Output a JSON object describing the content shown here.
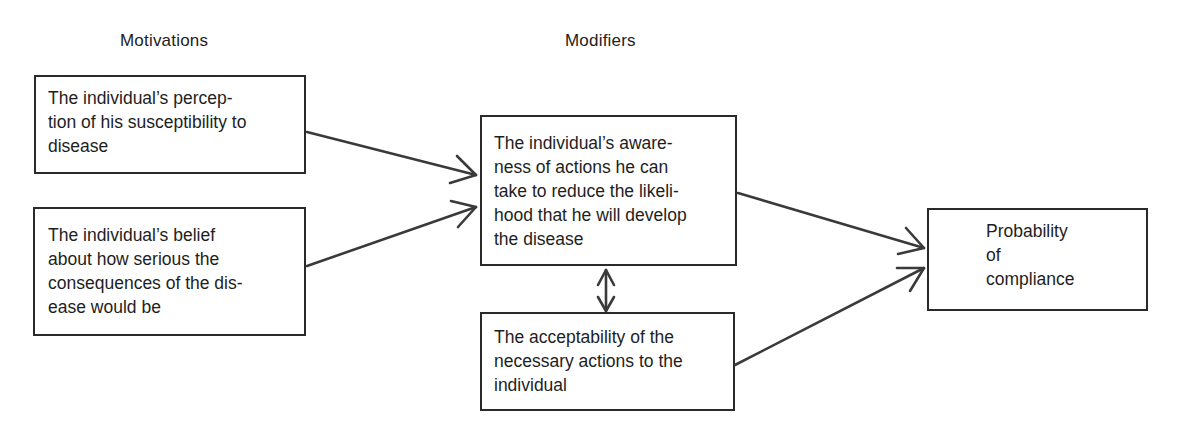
{
  "diagram": {
    "type": "flow",
    "columns": {
      "motivations": "Motivations",
      "modifiers": "Modifiers"
    },
    "nodes": {
      "susceptibility": {
        "lines": [
          "The individual’s percep-",
          "tion of his susceptibility to",
          "disease"
        ],
        "text": "The individual’s perception of his susceptibility to disease"
      },
      "seriousness": {
        "lines": [
          "The individual’s belief",
          "about how serious the",
          "consequences of the dis-",
          "ease would be"
        ],
        "text": "The individual’s belief about how serious the consequences of the disease would be"
      },
      "awareness": {
        "lines": [
          "The individual’s aware-",
          "ness of actions he can",
          "take to reduce the likeli-",
          "hood that he will develop",
          "the disease"
        ],
        "text": "The individual’s awareness of actions he can take to reduce the likelihood that he will develop the disease"
      },
      "acceptability": {
        "lines": [
          "The acceptability of the",
          "necessary actions to the",
          "individual"
        ],
        "text": "The acceptability of the necessary actions to the individual"
      },
      "compliance": {
        "lines": [
          "Probability",
          "of",
          "compliance"
        ],
        "text": "Probability of compliance"
      }
    },
    "edges": [
      {
        "from": "susceptibility",
        "to": "awareness",
        "type": "arrow"
      },
      {
        "from": "seriousness",
        "to": "awareness",
        "type": "arrow"
      },
      {
        "from": "awareness",
        "to": "acceptability",
        "type": "double-arrow"
      },
      {
        "from": "awareness",
        "to": "compliance",
        "type": "arrow"
      },
      {
        "from": "acceptability",
        "to": "compliance",
        "type": "arrow"
      }
    ],
    "colors": {
      "line": "#3a3a3a",
      "text": "#1e1e1e",
      "background": "#ffffff"
    }
  }
}
